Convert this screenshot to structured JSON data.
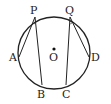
{
  "diagram": {
    "type": "circle-geometry",
    "circle": {
      "center_label": "O",
      "cx": 54,
      "cy": 53,
      "r": 36
    },
    "points": [
      {
        "label": "P",
        "x": 35,
        "y": 17
      },
      {
        "label": "Q",
        "x": 70,
        "y": 17
      },
      {
        "label": "A",
        "x": 19,
        "y": 57
      },
      {
        "label": "B",
        "x": 42,
        "y": 85
      },
      {
        "label": "C",
        "x": 66,
        "y": 85
      },
      {
        "label": "D",
        "x": 89,
        "y": 57
      }
    ],
    "segments": [
      [
        "P",
        "A"
      ],
      [
        "P",
        "B"
      ],
      [
        "Q",
        "C"
      ],
      [
        "Q",
        "D"
      ]
    ],
    "labels": {
      "P": "P",
      "Q": "Q",
      "A": "A",
      "B": "B",
      "C": "C",
      "D": "D",
      "O": "O"
    }
  }
}
